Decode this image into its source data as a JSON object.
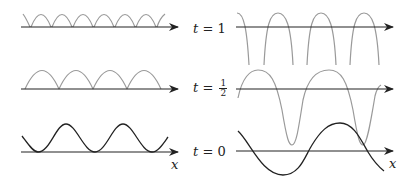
{
  "figure": {
    "colors": {
      "axis": "#222222",
      "curve_t0": "#222222",
      "curve_later": "#9a9a9a"
    },
    "time_labels": [
      {
        "var": "t",
        "eq": "=",
        "value": "1"
      },
      {
        "var": "t",
        "eq": "=",
        "num": "1",
        "den": "2"
      },
      {
        "var": "t",
        "eq": "=",
        "value": "0"
      }
    ],
    "axis_labels": {
      "left": "x",
      "right": "x"
    },
    "panels": {
      "left": [
        {
          "t": "1",
          "shape": "periodic arcs (cusps on axis)",
          "count": 7
        },
        {
          "t": "1/2",
          "shape": "periodic arcs (cusps on axis)",
          "count": 4
        },
        {
          "t": "0",
          "shape": "smooth periodic wave touching axis",
          "peaks": 2
        }
      ],
      "right": [
        {
          "t": "1",
          "shape": "inverted-U arcs plunging below axis",
          "count": 4
        },
        {
          "t": "1/2",
          "shape": "steepened oscillation",
          "peaks": 2,
          "troughs": 2
        },
        {
          "t": "0",
          "shape": "sine wave crossing axis",
          "peaks": 1,
          "troughs": 1
        }
      ]
    }
  }
}
